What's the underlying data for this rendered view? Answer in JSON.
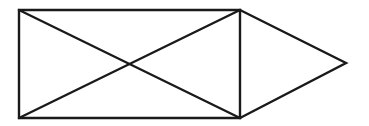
{
  "diagram": {
    "style": {
      "stroke_color": "#1a1a1a",
      "stroke_width": 2.4,
      "background": "#ffffff"
    },
    "rectangle": {
      "top_left": [
        19,
        10
      ],
      "top_right": [
        240,
        10
      ],
      "bottom_right": [
        240,
        118
      ],
      "bottom_left": [
        19,
        118
      ]
    },
    "diagonals": [
      {
        "from": [
          19,
          10
        ],
        "to": [
          240,
          118
        ]
      },
      {
        "from": [
          19,
          118
        ],
        "to": [
          240,
          10
        ]
      }
    ],
    "triangle": {
      "top": [
        240,
        10
      ],
      "apex": [
        346,
        63
      ],
      "bottom": [
        240,
        118
      ]
    }
  }
}
